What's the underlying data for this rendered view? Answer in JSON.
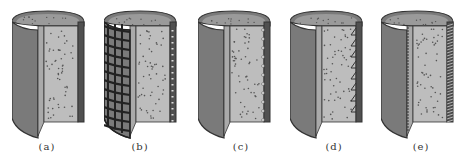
{
  "figure": {
    "colors": {
      "shell": "#7a7a7a",
      "shell_dark": "#505050",
      "core": "#bdbdbd",
      "outline": "#333333",
      "speckle": "#555555"
    },
    "panels": [
      {
        "id": "a",
        "label": "(a)",
        "variant": "plain"
      },
      {
        "id": "b",
        "label": "(b)",
        "variant": "grid-wrap"
      },
      {
        "id": "c",
        "label": "(c)",
        "variant": "dots"
      },
      {
        "id": "d",
        "label": "(d)",
        "variant": "teeth"
      },
      {
        "id": "e",
        "label": "(e)",
        "variant": "hatched"
      }
    ]
  }
}
